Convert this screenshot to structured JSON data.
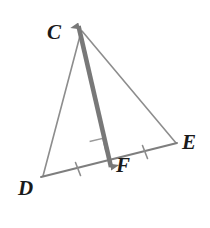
{
  "figure": {
    "background_color": "#ffffff",
    "width": 210,
    "height": 228,
    "labels": {
      "C": "C",
      "D": "D",
      "E": "E",
      "F": "F"
    },
    "label_color": "#1a1a1a",
    "points": {
      "C": {
        "x": 82,
        "y": 30
      },
      "D": {
        "x": 42,
        "y": 177
      },
      "E": {
        "x": 176,
        "y": 143
      },
      "F": {
        "x": 108,
        "y": 161
      },
      "arrow_top": {
        "x": 77,
        "y": 13
      },
      "arrow_bottom": {
        "x": 112,
        "y": 177
      }
    },
    "segments": [
      {
        "name": "side-CD",
        "from": "C",
        "to": "D",
        "color": "#8d8d8d",
        "width": 1.6
      },
      {
        "name": "side-CE",
        "from": "C",
        "to": "E",
        "color": "#8d8d8d",
        "width": 1.6
      },
      {
        "name": "side-DE",
        "from": "D",
        "to": "E",
        "color": "#7e7e7e",
        "width": 2.0
      },
      {
        "name": "line-CF",
        "from": "arrow_top",
        "to": "arrow_bottom",
        "color": "#787878",
        "width": 4.6,
        "arrows": "both"
      }
    ],
    "marks": {
      "right_angle": {
        "name": "right-angle-mark-at-F",
        "color": "#9a9a9a",
        "size": 14
      },
      "tick_DF": {
        "name": "congruence-tick-DF",
        "color": "#8d8d8d",
        "x": 78,
        "y": 169
      },
      "tick_FE": {
        "name": "congruence-tick-FE",
        "color": "#8d8d8d",
        "x": 145,
        "y": 152
      }
    }
  }
}
